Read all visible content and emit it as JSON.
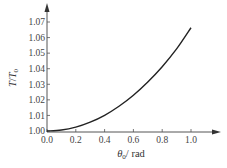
{
  "chart_data": {
    "type": "line",
    "title": "",
    "xlabel": "θ0 / rad",
    "ylabel": "T / T0",
    "xlim": [
      0.0,
      1.0
    ],
    "ylim": [
      1.0,
      1.07
    ],
    "x_ticks": [
      "0.0",
      "0.2",
      "0.4",
      "0.6",
      "0.8",
      "1.0"
    ],
    "y_ticks": [
      "1.00",
      "1.01",
      "1.02",
      "1.03",
      "1.04",
      "1.05",
      "1.06",
      "1.07"
    ],
    "grid": false,
    "legend": null,
    "series": [
      {
        "name": "T/T0",
        "x": [
          0.0,
          0.1,
          0.2,
          0.3,
          0.4,
          0.5,
          0.6,
          0.7,
          0.8,
          0.9,
          1.0
        ],
        "values": [
          1.0,
          1.0006,
          1.0025,
          1.0057,
          1.0101,
          1.0159,
          1.023,
          1.0315,
          1.0413,
          1.0527,
          1.0663
        ]
      }
    ],
    "colors": {
      "curve": "#222222",
      "axis": "#555555",
      "text": "#444444"
    }
  },
  "labels": {
    "y_axis_main": "T",
    "y_axis_slash": "/",
    "y_axis_denom": "T",
    "y_axis_sub": "0",
    "x_axis_main": "θ",
    "x_axis_sub": "0",
    "x_axis_unit": "/ rad"
  }
}
